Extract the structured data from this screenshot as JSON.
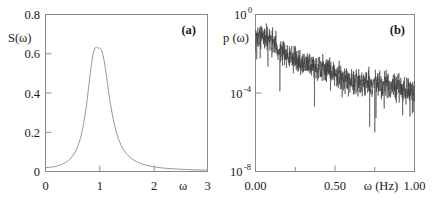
{
  "figure": {
    "panel_count": 2,
    "background": "#ffffff"
  },
  "chart_data": [
    {
      "type": "line",
      "panel_label": "(a)",
      "title": "",
      "xlabel": "ω",
      "ylabel": "S(ω)",
      "xlim": [
        0,
        3
      ],
      "ylim": [
        0,
        0.8
      ],
      "xscale": "linear",
      "yscale": "linear",
      "grid": false,
      "legend": null,
      "xticks": [
        0,
        1,
        2,
        3
      ],
      "xtick_labels": [
        "0",
        "1",
        "2",
        "3"
      ],
      "yticks": [
        0,
        0.2,
        0.4,
        0.6,
        0.8
      ],
      "ytick_labels": [
        "0",
        "0.2",
        "0.4",
        "0.6",
        "0.8"
      ],
      "line_color": "#9a9a9a",
      "description": "Lorentzian resonance peak centred at ω = 1 with maximum S ≈ 0.63",
      "peak": {
        "x": 1.0,
        "y": 0.63
      },
      "x": [
        0.0,
        0.05,
        0.1,
        0.15,
        0.2,
        0.25,
        0.3,
        0.35,
        0.4,
        0.45,
        0.5,
        0.55,
        0.6,
        0.65,
        0.7,
        0.75,
        0.78,
        0.8,
        0.82,
        0.85,
        0.88,
        0.9,
        0.92,
        0.94,
        0.96,
        0.98,
        1.0,
        1.02,
        1.04,
        1.06,
        1.08,
        1.1,
        1.12,
        1.15,
        1.18,
        1.2,
        1.25,
        1.3,
        1.35,
        1.4,
        1.45,
        1.5,
        1.6,
        1.7,
        1.8,
        1.9,
        2.0,
        2.1,
        2.2,
        2.4,
        2.6,
        2.8,
        3.0
      ],
      "y": [
        0.02,
        0.021,
        0.022,
        0.024,
        0.027,
        0.031,
        0.036,
        0.042,
        0.051,
        0.062,
        0.078,
        0.099,
        0.129,
        0.172,
        0.233,
        0.32,
        0.385,
        0.432,
        0.48,
        0.545,
        0.595,
        0.617,
        0.63,
        0.633,
        0.631,
        0.628,
        0.63,
        0.626,
        0.616,
        0.598,
        0.572,
        0.54,
        0.503,
        0.443,
        0.384,
        0.348,
        0.271,
        0.211,
        0.167,
        0.134,
        0.109,
        0.09,
        0.064,
        0.048,
        0.037,
        0.03,
        0.024,
        0.02,
        0.017,
        0.013,
        0.01,
        0.008,
        0.007
      ]
    },
    {
      "type": "line",
      "panel_label": "(b)",
      "title": "",
      "xlabel": "ω (Hz)",
      "ylabel": "p (ω)",
      "xlim": [
        0.0,
        1.0
      ],
      "ylim": [
        1e-08,
        1.0
      ],
      "xscale": "linear",
      "yscale": "log",
      "grid": false,
      "legend": null,
      "xticks": [
        0.0,
        0.5,
        1.0
      ],
      "xtick_labels": [
        "0.00",
        "0.50",
        "1.00"
      ],
      "xminor_ticks": [
        0.25,
        0.75
      ],
      "yticks": [
        1.0,
        0.0001,
        1e-08
      ],
      "ytick_labels": [
        "10^0",
        "10^-4",
        "10^-8"
      ],
      "ytick_mantissa": "10",
      "ytick_exponents": [
        "0",
        "-4",
        "-8"
      ],
      "line_color": "#3a3a3a",
      "description": "Noisy power spectrum decaying from about 10^-1 near zero frequency to roughly 10^-4 at 1 Hz, with dense high-frequency fluctuations and downward spikes",
      "envelope_x": [
        0.0,
        0.05,
        0.1,
        0.15,
        0.2,
        0.25,
        0.3,
        0.35,
        0.4,
        0.45,
        0.5,
        0.55,
        0.6,
        0.65,
        0.7,
        0.75,
        0.8,
        0.85,
        0.9,
        0.95,
        1.0
      ],
      "envelope_y": [
        0.06,
        0.09,
        0.04,
        0.016,
        0.008,
        0.005,
        0.0032,
        0.0024,
        0.0018,
        0.0013,
        0.0009,
        0.0006,
        0.00045,
        0.00038,
        0.00034,
        0.0003,
        0.00026,
        0.00022,
        0.00018,
        0.00014,
        0.00011
      ]
    }
  ]
}
